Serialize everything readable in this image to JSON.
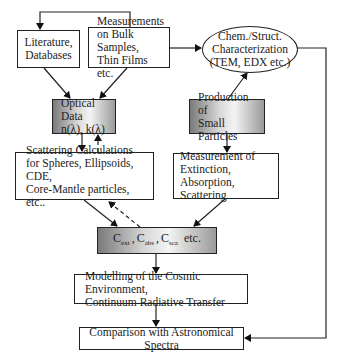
{
  "diagram": {
    "nodes": {
      "literature": {
        "lines": [
          "Literature,",
          "Databases"
        ]
      },
      "measurements": {
        "lines": [
          "Measurements",
          "on Bulk Samples,",
          "Thin Films etc."
        ]
      },
      "characterization": {
        "lines": [
          "Chem./Struct.",
          "Characterization",
          "(TEM, EDX etc.)"
        ]
      },
      "optical_data": {
        "lines": [
          "Optical Data",
          "n(λ), k(λ)"
        ]
      },
      "production": {
        "lines": [
          "Production of",
          "Small Particles"
        ]
      },
      "scattering": {
        "lines": [
          "Scattering Calculations",
          "for Spheres, Ellipsoids, CDE,",
          "Core-Mantle particles, etc.."
        ]
      },
      "extinction": {
        "lines": [
          "Measurement of",
          "Extinction, Absorption,",
          "Scattering"
        ]
      },
      "cross_sections": {
        "items": [
          {
            "sym": "C",
            "sub": "ext"
          },
          {
            "sym": "C",
            "sub": "abs"
          },
          {
            "sym": "C",
            "sub": "sca"
          }
        ],
        "suffix": "etc.",
        "sep": ","
      },
      "modelling": {
        "lines": [
          "Modelling of the Cosmic Environment,",
          "Continuum Radiative Transfer"
        ]
      },
      "comparison": {
        "lines": [
          "Comparison with Astronomical Spectra"
        ]
      }
    },
    "edges": [
      {
        "from": "measurements",
        "to": "literature",
        "style": "solid"
      },
      {
        "from": "measurements",
        "to": "characterization",
        "style": "solid"
      },
      {
        "from": "literature",
        "to": "optical_data",
        "style": "solid"
      },
      {
        "from": "measurements",
        "to": "optical_data",
        "style": "solid"
      },
      {
        "from": "production",
        "to": "characterization",
        "style": "solid"
      },
      {
        "from": "characterization",
        "to": "comparison",
        "style": "solid"
      },
      {
        "from": "optical_data",
        "to": "scattering",
        "style": "solid"
      },
      {
        "from": "scattering",
        "to": "optical_data",
        "style": "dashed"
      },
      {
        "from": "production",
        "to": "extinction",
        "style": "solid"
      },
      {
        "from": "scattering",
        "to": "cross_sections",
        "style": "solid"
      },
      {
        "from": "cross_sections",
        "to": "scattering",
        "style": "dashed"
      },
      {
        "from": "extinction",
        "to": "cross_sections",
        "style": "solid"
      },
      {
        "from": "cross_sections",
        "to": "modelling",
        "style": "solid"
      },
      {
        "from": "modelling",
        "to": "comparison",
        "style": "solid"
      }
    ]
  }
}
